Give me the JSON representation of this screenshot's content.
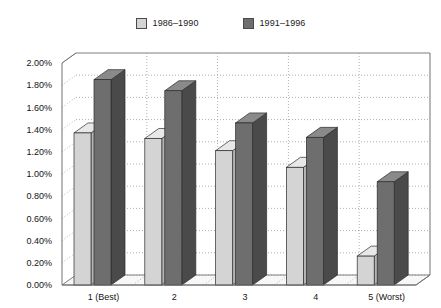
{
  "legend": {
    "entries": [
      {
        "label": "1986–1990",
        "color": "#d4d4d4",
        "swatch_name": "legend-swatch-1986-1990"
      },
      {
        "label": "1991–1996",
        "color": "#6e6e6e",
        "swatch_name": "legend-swatch-1991-1996"
      }
    ]
  },
  "axes": {
    "y_tick_labels": [
      "2.00%",
      "1.80%",
      "1.60%",
      "1.40%",
      "1.20%",
      "1.00%",
      "0.80%",
      "0.60%",
      "0.40%",
      "0.20%",
      "0.00%"
    ],
    "x_tick_labels": [
      "1 (Best)",
      "2",
      "3",
      "4",
      "5 (Worst)"
    ]
  },
  "chart_data": {
    "type": "bar",
    "title": "",
    "subtitle": "",
    "xlabel": "",
    "ylabel": "",
    "categories": [
      "1 (Best)",
      "2",
      "3",
      "4",
      "5 (Worst)"
    ],
    "series": [
      {
        "name": "1986–1990",
        "color": "#d4d4d4",
        "values": [
          1.37,
          1.32,
          1.21,
          1.06,
          0.26
        ]
      },
      {
        "name": "1991–1996",
        "color": "#6e6e6e",
        "values": [
          1.85,
          1.75,
          1.46,
          1.33,
          0.93
        ]
      }
    ],
    "ylim": [
      0.0,
      2.0
    ],
    "ytick_step": 0.2,
    "yunit": "%",
    "grid": true,
    "grid_axis": "y",
    "legend_position": "top",
    "style": "3d-clustered-column"
  },
  "colors": {
    "bar_light": "#d4d4d4",
    "bar_light_side": "#b4b4b4",
    "bar_light_top": "#e8e8e8",
    "bar_dark": "#6e6e6e",
    "bar_dark_side": "#4a4a4a",
    "bar_dark_top": "#8a8a8a",
    "bar_outline": "#2b2b2b",
    "plot_bg": "#ffffff",
    "floor": "#f7f7f7",
    "gridline": "#9a9a9a",
    "axis_line": "#707070",
    "text": "#141414"
  }
}
